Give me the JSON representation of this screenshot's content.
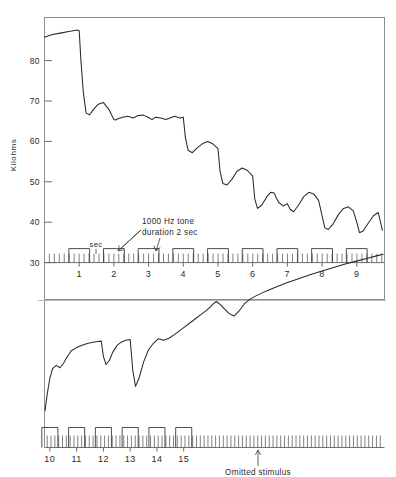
{
  "figure": {
    "title_clipped": "SKIN CONDUCTANCE AND HABITUATION",
    "background_color": "#ffffff",
    "trace_color": "#2a2a2a",
    "frame_color": "#8e8e8e"
  },
  "annotations": {
    "tone_label_line1": "1000  Hz tone",
    "tone_label_line2": "duration 2 sec",
    "sec_label": "sec",
    "omitted_label": "Omitted  stimulus"
  },
  "chart_data": {
    "type": "line",
    "title": "SKIN CONDUCTANCE AND HABITUATION",
    "xlabel": "",
    "ylabel": "Kilohms",
    "grid": false,
    "legend": null,
    "panels": [
      {
        "name": "upper-panel",
        "ylabel": "Kilohms",
        "yticks": [
          30,
          40,
          50,
          60,
          70,
          80
        ],
        "ylim": [
          28,
          90
        ],
        "xlim": [
          0,
          9.8
        ],
        "xticks": [
          1,
          2,
          3,
          4,
          5,
          6,
          7,
          8,
          9
        ],
        "stimuli": [
          1,
          2,
          3,
          4,
          5,
          6,
          7,
          8,
          9
        ],
        "stimulus_duration_sec": 2,
        "tick_interval_sec": 1,
        "series": [
          {
            "name": "skin-resistance",
            "units": "kilohms",
            "x": [
              0.0,
              0.2,
              0.45,
              0.7,
              0.95,
              1.0,
              1.05,
              1.12,
              1.2,
              1.3,
              1.42,
              1.55,
              1.7,
              1.85,
              2.0,
              2.05,
              2.12,
              2.25,
              2.4,
              2.55,
              2.7,
              2.85,
              3.0,
              3.1,
              3.2,
              3.35,
              3.5,
              3.62,
              3.75,
              3.9,
              4.0,
              4.06,
              4.14,
              4.26,
              4.4,
              4.55,
              4.7,
              4.85,
              5.0,
              5.06,
              5.14,
              5.26,
              5.4,
              5.55,
              5.7,
              5.85,
              6.0,
              6.06,
              6.14,
              6.26,
              6.4,
              6.52,
              6.62,
              6.74,
              6.88,
              7.0,
              7.08,
              7.18,
              7.32,
              7.48,
              7.62,
              7.76,
              7.9,
              8.0,
              8.08,
              8.18,
              8.32,
              8.48,
              8.62,
              8.76,
              8.9,
              9.0,
              9.08,
              9.18,
              9.32,
              9.48,
              9.62,
              9.74
            ],
            "y": [
              85.8,
              86.4,
              86.8,
              87.2,
              87.6,
              87.4,
              80.0,
              72.0,
              67.0,
              66.6,
              68.0,
              69.2,
              69.6,
              68.0,
              65.4,
              65.3,
              65.6,
              66.0,
              66.2,
              65.8,
              66.4,
              66.5,
              65.9,
              65.4,
              66.0,
              65.8,
              65.4,
              65.8,
              66.2,
              65.8,
              66.0,
              61.0,
              57.8,
              57.2,
              58.4,
              59.4,
              60.0,
              59.4,
              58.2,
              52.6,
              49.6,
              49.2,
              50.6,
              52.6,
              53.4,
              52.8,
              51.4,
              45.8,
              43.4,
              44.2,
              46.2,
              47.4,
              47.2,
              45.0,
              44.0,
              44.6,
              43.2,
              42.6,
              44.2,
              46.4,
              47.4,
              47.0,
              45.4,
              41.6,
              38.6,
              38.2,
              39.6,
              42.0,
              43.4,
              43.8,
              42.8,
              40.0,
              37.4,
              37.8,
              39.6,
              41.6,
              42.4,
              38.0
            ]
          }
        ]
      },
      {
        "name": "lower-panel",
        "ylabel": "",
        "yticks": [],
        "ylim": [
          28,
          90
        ],
        "xlim": [
          9.8,
          22.5
        ],
        "xticks": [
          10,
          11,
          12,
          13,
          14,
          15
        ],
        "stimuli": [
          10,
          11,
          12,
          13,
          14,
          15
        ],
        "omitted_stimulus_at": 16,
        "stimulus_duration_sec": 2,
        "tick_interval_sec": 1,
        "series": [
          {
            "name": "skin-resistance",
            "units": "kilohms",
            "x": [
              9.82,
              9.9,
              10.0,
              10.1,
              10.24,
              10.38,
              10.5,
              10.62,
              10.8,
              11.0,
              11.2,
              11.4,
              11.6,
              11.8,
              11.92,
              12.0,
              12.1,
              12.22,
              12.36,
              12.52,
              12.68,
              12.84,
              13.0,
              13.1,
              13.2,
              13.34,
              13.5,
              13.68,
              13.86,
              14.05,
              14.25,
              14.45,
              14.65,
              14.85,
              15.05,
              15.25,
              15.45,
              15.65,
              15.85,
              16.0,
              16.1,
              16.22,
              16.36,
              16.52,
              16.7,
              16.88,
              17.06,
              17.26,
              17.48,
              17.7,
              17.95,
              18.2,
              18.5,
              18.8,
              19.1,
              19.45,
              19.8,
              20.2,
              20.6,
              21.0,
              21.45,
              21.9,
              22.2,
              22.45
            ],
            "y": [
              30.0,
              34.0,
              38.0,
              40.4,
              41.2,
              40.6,
              41.6,
              43.0,
              44.8,
              45.6,
              46.2,
              46.6,
              46.9,
              47.1,
              47.2,
              43.4,
              41.4,
              42.4,
              44.6,
              46.2,
              47.0,
              47.4,
              47.6,
              39.8,
              36.0,
              38.2,
              42.0,
              45.0,
              46.6,
              47.8,
              47.4,
              47.9,
              48.8,
              49.8,
              50.8,
              51.8,
              52.8,
              53.8,
              54.8,
              55.7,
              56.4,
              57.0,
              56.3,
              55.2,
              54.0,
              53.4,
              54.6,
              56.4,
              57.6,
              58.4,
              59.2,
              59.9,
              60.7,
              61.5,
              62.2,
              63.0,
              63.8,
              64.6,
              65.4,
              66.2,
              67.0,
              67.8,
              68.3,
              68.7
            ]
          }
        ]
      }
    ]
  }
}
